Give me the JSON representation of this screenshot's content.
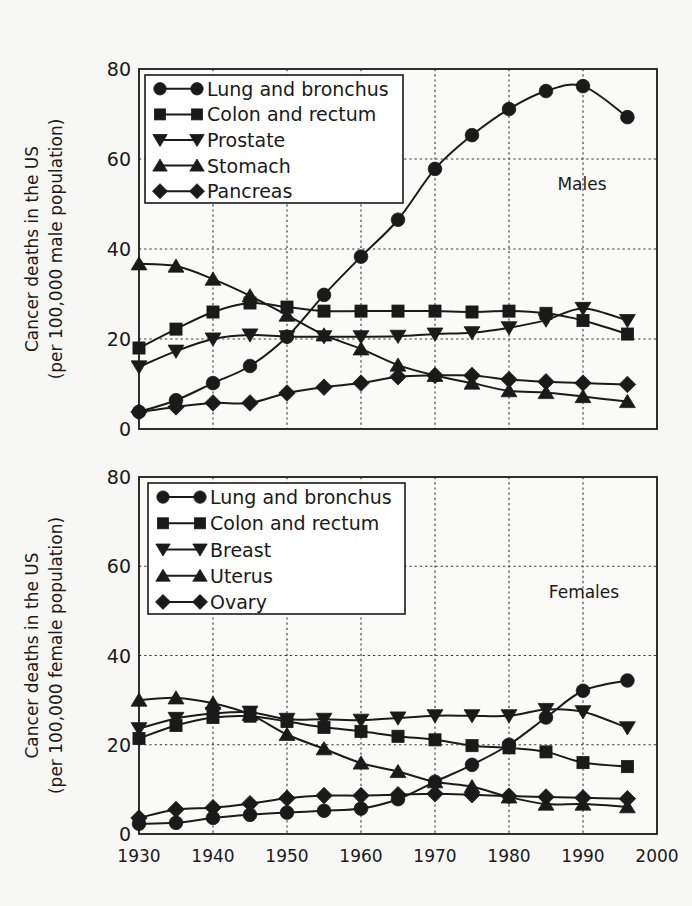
{
  "chart_data": [
    {
      "type": "line",
      "panel": "top",
      "title": "",
      "annotation": "Males",
      "xlabel": "",
      "ylabel_line1": "Cancer deaths in the US",
      "ylabel_line2": "(per 100,000 male population)",
      "xlim": [
        1930,
        2000
      ],
      "ylim": [
        0,
        80
      ],
      "x_ticks": [
        1930,
        1940,
        1950,
        1960,
        1970,
        1980,
        1990,
        2000
      ],
      "y_ticks": [
        0,
        20,
        40,
        60,
        80
      ],
      "grid": true,
      "legend_position": "upper left",
      "x": [
        1930,
        1935,
        1940,
        1945,
        1950,
        1955,
        1960,
        1965,
        1970,
        1975,
        1980,
        1985,
        1990,
        1996
      ],
      "series": [
        {
          "name": "Lung and bronchus",
          "marker": "circle",
          "values": [
            3.8,
            6.4,
            10.2,
            14.0,
            20.5,
            29.8,
            38.3,
            46.5,
            57.8,
            65.3,
            71.1,
            75.1,
            76.2,
            69.3
          ]
        },
        {
          "name": "Colon and rectum",
          "marker": "square",
          "values": [
            18.0,
            22.2,
            26.0,
            28.0,
            27.1,
            26.2,
            26.2,
            26.2,
            26.2,
            26.0,
            26.2,
            25.7,
            24.1,
            21.1
          ]
        },
        {
          "name": "Prostate",
          "marker": "triangle-down",
          "values": [
            13.8,
            17.3,
            20.0,
            20.9,
            20.5,
            20.5,
            20.5,
            20.6,
            21.1,
            21.4,
            22.5,
            24.2,
            26.8,
            24.1
          ]
        },
        {
          "name": "Stomach",
          "marker": "triangle-up",
          "values": [
            36.7,
            36.2,
            33.3,
            29.6,
            25.3,
            20.9,
            17.8,
            14.2,
            11.9,
            10.2,
            8.5,
            8.1,
            7.2,
            6.1
          ]
        },
        {
          "name": "Pancreas",
          "marker": "diamond",
          "values": [
            3.8,
            4.9,
            5.8,
            5.8,
            8.0,
            9.3,
            10.2,
            11.6,
            11.9,
            11.9,
            11.0,
            10.5,
            10.2,
            9.9
          ]
        }
      ]
    },
    {
      "type": "line",
      "panel": "bottom",
      "title": "",
      "annotation": "Females",
      "xlabel": "",
      "ylabel_line1": "Cancer deaths in the US",
      "ylabel_line2": "(per 100,000 female population)",
      "xlim": [
        1930,
        2000
      ],
      "ylim": [
        0,
        80
      ],
      "x_ticks": [
        1930,
        1940,
        1950,
        1960,
        1970,
        1980,
        1990,
        2000
      ],
      "y_ticks": [
        0,
        20,
        40,
        60,
        80
      ],
      "grid": true,
      "legend_position": "upper left",
      "x": [
        1930,
        1935,
        1940,
        1945,
        1950,
        1955,
        1960,
        1965,
        1970,
        1975,
        1980,
        1985,
        1990,
        1996
      ],
      "series": [
        {
          "name": "Lung and bronchus",
          "marker": "circle",
          "values": [
            2.3,
            2.5,
            3.6,
            4.3,
            4.8,
            5.2,
            5.7,
            7.8,
            11.7,
            15.5,
            20.0,
            26.1,
            32.1,
            34.4
          ]
        },
        {
          "name": "Colon and rectum",
          "marker": "square",
          "values": [
            21.4,
            24.3,
            26.1,
            26.4,
            25.2,
            23.9,
            23.0,
            21.9,
            21.1,
            19.8,
            19.3,
            18.4,
            16.0,
            15.1
          ]
        },
        {
          "name": "Breast",
          "marker": "triangle-down",
          "values": [
            23.6,
            25.9,
            27.0,
            27.3,
            25.7,
            25.7,
            25.5,
            26.0,
            26.5,
            26.5,
            26.5,
            27.9,
            27.4,
            23.8
          ]
        },
        {
          "name": "Uterus",
          "marker": "triangle-up",
          "values": [
            30.0,
            30.5,
            29.3,
            26.8,
            22.3,
            19.1,
            15.9,
            14.0,
            11.7,
            10.6,
            8.3,
            6.7,
            6.7,
            6.1
          ]
        },
        {
          "name": "Ovary",
          "marker": "diamond",
          "values": [
            3.6,
            5.5,
            5.9,
            6.8,
            8.0,
            8.6,
            8.6,
            8.8,
            9.0,
            8.8,
            8.5,
            8.3,
            8.1,
            7.9
          ]
        }
      ]
    }
  ],
  "colors": {
    "background": "#f7f7f5",
    "ink": "#1a1a1a",
    "grid": "#333333"
  }
}
